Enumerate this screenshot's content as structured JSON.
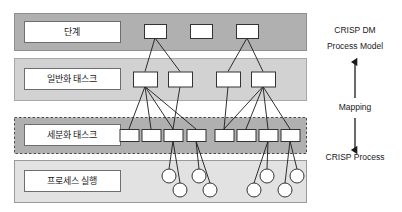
{
  "figure": {
    "background": "#ffffff"
  },
  "bands": [
    {
      "id": "phase",
      "label": "단계",
      "fill": "#b0b0b0",
      "border": "#8f8f8f",
      "border_style": "solid",
      "x": 14,
      "y": 13,
      "w": 292,
      "h": 37,
      "label_box": {
        "x": 24,
        "y": 21,
        "w": 96,
        "h": 21,
        "fill": "#ffffff"
      }
    },
    {
      "id": "generic-task",
      "label": "일반화 태스크",
      "fill": "#d2d2d2",
      "border": "#a8a8a8",
      "border_style": "solid",
      "x": 14,
      "y": 58,
      "w": 292,
      "h": 42,
      "label_box": {
        "x": 24,
        "y": 68,
        "w": 96,
        "h": 21,
        "fill": "#ffffff"
      }
    },
    {
      "id": "specialized-task",
      "label": "세분화 태스크",
      "fill": "#b0b0b0",
      "border": "#4d4d4d",
      "border_style": "dashed",
      "x": 14,
      "y": 117,
      "w": 292,
      "h": 36,
      "label_box": {
        "x": 24,
        "y": 124,
        "w": 96,
        "h": 21,
        "fill": "#ffffff"
      }
    },
    {
      "id": "process-instance",
      "label": "프로세스 실행",
      "fill": "#e2e2e2",
      "border": "#9a9a9a",
      "border_style": "solid",
      "x": 14,
      "y": 160,
      "w": 292,
      "h": 42,
      "label_box": {
        "x": 24,
        "y": 170,
        "w": 96,
        "h": 21,
        "fill": "#ffffff"
      }
    }
  ],
  "nodes": {
    "phase_boxes": [
      {
        "id": "p1",
        "cx": 155,
        "cy": 31,
        "w": 22,
        "h": 14
      },
      {
        "id": "p2",
        "cx": 201,
        "cy": 31,
        "w": 22,
        "h": 14
      },
      {
        "id": "p3",
        "cx": 247,
        "cy": 31,
        "w": 22,
        "h": 14
      }
    ],
    "generic_boxes": [
      {
        "id": "g1",
        "cx": 145,
        "cy": 79,
        "w": 24,
        "h": 15
      },
      {
        "id": "g2",
        "cx": 180,
        "cy": 79,
        "w": 24,
        "h": 15
      },
      {
        "id": "g3",
        "cx": 228,
        "cy": 79,
        "w": 24,
        "h": 15
      },
      {
        "id": "g4",
        "cx": 263,
        "cy": 79,
        "w": 24,
        "h": 15
      }
    ],
    "specialized_boxes": [
      {
        "id": "s1",
        "cx": 129,
        "cy": 135,
        "w": 19,
        "h": 12
      },
      {
        "id": "s2",
        "cx": 151,
        "cy": 135,
        "w": 19,
        "h": 12
      },
      {
        "id": "s3",
        "cx": 173,
        "cy": 135,
        "w": 19,
        "h": 12
      },
      {
        "id": "s4",
        "cx": 196,
        "cy": 135,
        "w": 19,
        "h": 12
      },
      {
        "id": "s5",
        "cx": 224,
        "cy": 135,
        "w": 19,
        "h": 12
      },
      {
        "id": "s6",
        "cx": 246,
        "cy": 135,
        "w": 19,
        "h": 12
      },
      {
        "id": "s7",
        "cx": 268,
        "cy": 135,
        "w": 19,
        "h": 12
      },
      {
        "id": "s8",
        "cx": 290,
        "cy": 135,
        "w": 19,
        "h": 12
      }
    ],
    "instance_circles": [
      {
        "id": "c1",
        "cx": 169,
        "cy": 176,
        "r": 7
      },
      {
        "id": "c2",
        "cx": 180,
        "cy": 190,
        "r": 7
      },
      {
        "id": "c3",
        "cx": 199,
        "cy": 176,
        "r": 7
      },
      {
        "id": "c4",
        "cx": 210,
        "cy": 190,
        "r": 7
      },
      {
        "id": "c5",
        "cx": 254,
        "cy": 190,
        "r": 7
      },
      {
        "id": "c6",
        "cx": 267,
        "cy": 176,
        "r": 7
      },
      {
        "id": "c7",
        "cx": 285,
        "cy": 190,
        "r": 7
      },
      {
        "id": "c8",
        "cx": 297,
        "cy": 176,
        "r": 7
      }
    ]
  },
  "edges": {
    "phase_to_generic": [
      {
        "from": "p1",
        "to": "g1"
      },
      {
        "from": "p1",
        "to": "g2"
      },
      {
        "from": "p3",
        "to": "g3"
      },
      {
        "from": "p3",
        "to": "g4"
      }
    ],
    "generic_to_specialized": [
      {
        "from": "g1",
        "to": "s1"
      },
      {
        "from": "g1",
        "to": "s2"
      },
      {
        "from": "g1",
        "to": "s3"
      },
      {
        "from": "g1",
        "to": "s4"
      },
      {
        "from": "g2",
        "to": "s3"
      },
      {
        "from": "g4",
        "to": "s5"
      },
      {
        "from": "g4",
        "to": "s6"
      },
      {
        "from": "g4",
        "to": "s7"
      },
      {
        "from": "g4",
        "to": "s8"
      },
      {
        "from": "g3",
        "to": "s5"
      }
    ],
    "specialized_to_instance": [
      {
        "from": "s3",
        "to": "c1"
      },
      {
        "from": "s3",
        "to": "c2"
      },
      {
        "from": "s4",
        "to": "c3"
      },
      {
        "from": "s4",
        "to": "c4"
      },
      {
        "from": "s7",
        "to": "c5"
      },
      {
        "from": "s7",
        "to": "c6"
      },
      {
        "from": "s8",
        "to": "c7"
      },
      {
        "from": "s8",
        "to": "c8"
      }
    ]
  },
  "annotations": {
    "top_label_line1": "CRISP DM",
    "top_label_line2": "Process Model",
    "mapping_label": "Mapping",
    "bottom_label": "CRISP Process"
  },
  "colors": {
    "node_fill": "#ffffff",
    "node_stroke": "#333333",
    "edge_stroke": "#1a1a1a",
    "text": "#1a1a1a"
  }
}
